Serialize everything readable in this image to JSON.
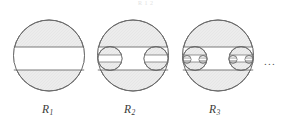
{
  "figure": {
    "caption_top_faint": "R 1 2",
    "ellipsis": "...",
    "background_color": "#ffffff",
    "fill_color": "#ebebeb",
    "stroke_color": "#6b6b6b",
    "band_fill_color": "#ffffff",
    "items": [
      {
        "label_base": "R",
        "label_sub": "1",
        "label_full": "R1",
        "iteration": 1,
        "circle": {
          "cx": 49,
          "cy": 55.5,
          "r": 35.5
        },
        "band": {
          "top": 47,
          "bottom": 70
        },
        "child_circle_count": 0
      },
      {
        "label_base": "R",
        "label_sub": "2",
        "label_full": "R2",
        "iteration": 2,
        "circle": {
          "cx": 133,
          "cy": 55.5,
          "r": 35.5
        },
        "band": {
          "top": 47,
          "bottom": 70
        },
        "child_circle_count": 2,
        "child_circle_radius": 12
      },
      {
        "label_base": "R",
        "label_sub": "3",
        "label_full": "R3",
        "iteration": 3,
        "circle": {
          "cx": 218,
          "cy": 55.5,
          "r": 35.5
        },
        "band": {
          "top": 47,
          "bottom": 70
        },
        "child_circle_count": 2,
        "child_circle_radius": 12,
        "grandchild_circle_count": 4,
        "grandchild_circle_radius": 4
      }
    ]
  }
}
